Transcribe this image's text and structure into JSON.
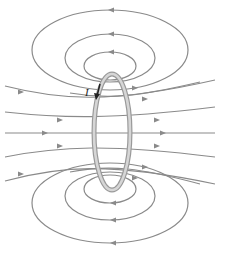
{
  "diagram": {
    "current_label": "I",
    "colors": {
      "field_line": "#8a8a8a",
      "loop_outer": "#9a9a9a",
      "loop_inner": "#d6d6d6",
      "current_arrow": "#222222"
    },
    "components": [
      "current loop (side view)",
      "field lines (closed loops around wire)",
      "field lines through loop center",
      "current arrow"
    ]
  }
}
